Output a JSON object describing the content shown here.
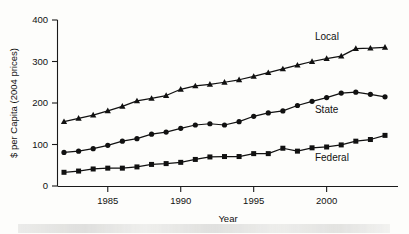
{
  "chart_data": {
    "type": "line",
    "title": "",
    "xlabel": "Year",
    "ylabel": "$ per Capita (2004 prices)",
    "xlim": [
      1982,
      2004
    ],
    "ylim": [
      0,
      400
    ],
    "yticks": [
      0,
      100,
      200,
      300,
      400
    ],
    "xticks": [
      1985,
      1990,
      1995,
      2000
    ],
    "xtick_labels": [
      "1985",
      "1990",
      "1995",
      "2000"
    ],
    "ytick_labels": [
      "0",
      "100",
      "200",
      "300",
      "400"
    ],
    "grid": false,
    "legend": "inline-series-labels",
    "x": [
      1982,
      1983,
      1984,
      1985,
      1986,
      1987,
      1988,
      1989,
      1990,
      1991,
      1992,
      1993,
      1994,
      1995,
      1996,
      1997,
      1998,
      1999,
      2000,
      2001,
      2002,
      2003,
      2004
    ],
    "series": [
      {
        "name": "Local",
        "marker": "triangle",
        "label_x": 1999.2,
        "label_y": 352,
        "values": [
          155,
          163,
          171,
          181,
          192,
          205,
          211,
          218,
          233,
          241,
          245,
          250,
          256,
          264,
          273,
          282,
          291,
          300,
          307,
          313,
          331,
          332,
          334
        ]
      },
      {
        "name": "State",
        "marker": "circle",
        "label_x": 1999.2,
        "label_y": 176,
        "values": [
          81,
          84,
          90,
          98,
          108,
          114,
          125,
          130,
          139,
          147,
          150,
          147,
          155,
          168,
          176,
          181,
          194,
          204,
          213,
          224,
          226,
          221,
          215
        ]
      },
      {
        "name": "Federal",
        "marker": "square",
        "label_x": 1999.2,
        "label_y": 60,
        "values": [
          33,
          36,
          41,
          43,
          43,
          46,
          52,
          54,
          57,
          64,
          70,
          71,
          71,
          78,
          78,
          91,
          84,
          92,
          94,
          99,
          108,
          112,
          122
        ]
      }
    ]
  },
  "axes": {
    "y_axis_title": "$ per Capita (2004 prices)",
    "x_axis_title": "Year"
  },
  "colors": {
    "ink": "#111111",
    "background": "#fdfdfb"
  }
}
